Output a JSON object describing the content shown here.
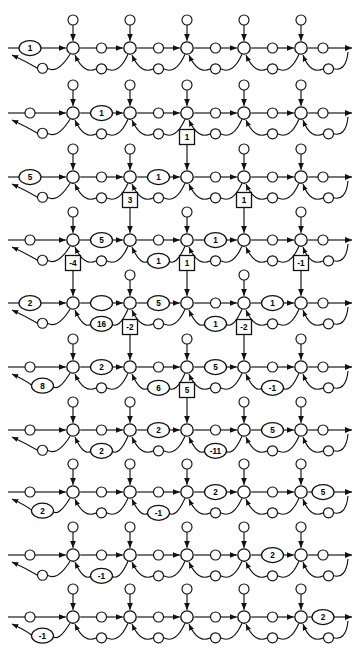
{
  "figure": {
    "rows_count": 10,
    "columns_count": 5,
    "stroke_color": "#111111",
    "fill_color": "#ffffff",
    "background": "#ffffff"
  },
  "geometry": {
    "width": 361,
    "height": 672,
    "row_y": [
      48,
      113,
      177,
      240,
      303,
      367,
      430,
      492,
      555,
      617
    ],
    "node_x": [
      73,
      130,
      187,
      244,
      301
    ],
    "node_r": 6.2,
    "place_r": 5.0,
    "top_offset": 28,
    "arc_dip": 26,
    "ellipse_rx": 11,
    "ellipse_ry": 7.5,
    "square_size": 15
  },
  "legend": {
    "node_shape": "circle-transition",
    "place_shape": "small-circle-place",
    "ellipse_token": "inline-token-ellipse",
    "square_token": "boxed-token-square"
  },
  "rows": [
    {
      "index": 1,
      "ellipse_labels": [
        {
          "slot": "entry",
          "value": "1"
        }
      ],
      "square_labels": []
    },
    {
      "index": 2,
      "ellipse_labels": [
        {
          "slot": "seg1",
          "value": "1"
        }
      ],
      "square_labels": []
    },
    {
      "index": 3,
      "ellipse_labels": [
        {
          "slot": "entry",
          "value": "5"
        },
        {
          "slot": "seg2",
          "value": "1"
        }
      ],
      "square_labels": [
        {
          "slot": "top3",
          "value": "1"
        }
      ]
    },
    {
      "index": 4,
      "ellipse_labels": [
        {
          "slot": "seg1",
          "value": "5"
        },
        {
          "slot": "arc2",
          "value": "1"
        },
        {
          "slot": "seg3",
          "value": "1"
        }
      ],
      "square_labels": [
        {
          "slot": "top2",
          "value": "3"
        },
        {
          "slot": "top4",
          "value": "1"
        }
      ]
    },
    {
      "index": 5,
      "ellipse_labels": [
        {
          "slot": "entry",
          "value": "2"
        },
        {
          "slot": "seg1",
          "value": ""
        },
        {
          "slot": "arc1",
          "value": "16"
        },
        {
          "slot": "seg2",
          "value": "5"
        },
        {
          "slot": "arc3",
          "value": "1"
        },
        {
          "slot": "seg4",
          "value": "1"
        }
      ],
      "square_labels": [
        {
          "slot": "top1",
          "value": "-4"
        },
        {
          "slot": "top3",
          "value": "1"
        },
        {
          "slot": "top5",
          "value": "-1"
        }
      ]
    },
    {
      "index": 6,
      "ellipse_labels": [
        {
          "slot": "arc0",
          "value": "8"
        },
        {
          "slot": "seg1",
          "value": "2"
        },
        {
          "slot": "arc2",
          "value": "6"
        },
        {
          "slot": "seg3",
          "value": "5"
        },
        {
          "slot": "arc4",
          "value": "-1"
        }
      ],
      "square_labels": [
        {
          "slot": "top2",
          "value": "-2"
        },
        {
          "slot": "top4",
          "value": "-2"
        }
      ]
    },
    {
      "index": 7,
      "ellipse_labels": [
        {
          "slot": "arc1",
          "value": "2"
        },
        {
          "slot": "seg2",
          "value": "2"
        },
        {
          "slot": "arc3",
          "value": "-11"
        },
        {
          "slot": "seg4",
          "value": "5"
        }
      ],
      "square_labels": [
        {
          "slot": "top3",
          "value": "5"
        }
      ]
    },
    {
      "index": 8,
      "ellipse_labels": [
        {
          "slot": "arc0",
          "value": "2"
        },
        {
          "slot": "arc2",
          "value": "-1"
        },
        {
          "slot": "seg3",
          "value": "2"
        },
        {
          "slot": "exit",
          "value": "5"
        }
      ],
      "square_labels": []
    },
    {
      "index": 9,
      "ellipse_labels": [
        {
          "slot": "arc1",
          "value": "-1"
        },
        {
          "slot": "seg4",
          "value": "2"
        }
      ],
      "square_labels": []
    },
    {
      "index": 10,
      "ellipse_labels": [
        {
          "slot": "arc0",
          "value": "-1"
        },
        {
          "slot": "exit",
          "value": "2"
        }
      ],
      "square_labels": []
    }
  ]
}
